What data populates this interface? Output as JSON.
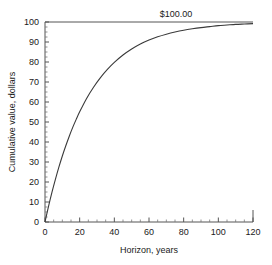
{
  "chart_data": {
    "type": "line",
    "title": "",
    "xlabel": "Horizon, years",
    "ylabel": "Cumulative value, dollars",
    "xlim": [
      0,
      120
    ],
    "ylim": [
      0,
      100
    ],
    "grid": false,
    "legend": null,
    "xticks": [
      0,
      20,
      40,
      60,
      80,
      100,
      120
    ],
    "xtick_labels": [
      "0",
      "20",
      "40",
      "60",
      "80",
      "100",
      "120"
    ],
    "x_minor_tick_interval": 5,
    "yticks": [
      0,
      10,
      20,
      30,
      40,
      50,
      60,
      70,
      80,
      90,
      100
    ],
    "ytick_labels": [
      "0",
      "10",
      "20",
      "30",
      "40",
      "50",
      "60",
      "70",
      "80",
      "90",
      "100"
    ],
    "y_minor_tick_interval": 2.5,
    "annotations": [
      {
        "text": "$100.00",
        "x": 62,
        "y": 100,
        "position": "above-asymptote"
      }
    ],
    "asymptote": 100,
    "series": [
      {
        "name": "Cumulative value",
        "color": "#3a3a3a",
        "x": [
          0,
          2,
          4,
          6,
          8,
          10,
          12,
          14,
          16,
          18,
          20,
          24,
          28,
          32,
          36,
          40,
          45,
          50,
          55,
          60,
          65,
          70,
          75,
          80,
          85,
          90,
          95,
          100,
          105,
          110,
          115,
          120
        ],
        "y": [
          0.0,
          7.7,
          14.8,
          21.3,
          27.4,
          33.0,
          38.1,
          42.9,
          47.3,
          51.3,
          55.1,
          61.8,
          67.4,
          72.2,
          76.3,
          79.8,
          83.5,
          86.5,
          89.0,
          91.0,
          92.6,
          93.9,
          95.0,
          95.9,
          96.6,
          97.2,
          97.7,
          98.2,
          98.5,
          98.8,
          99.0,
          99.2
        ]
      }
    ]
  },
  "axes": {
    "x_title": "Horizon, years",
    "y_title": "Cumulative value, dollars"
  },
  "annotation": {
    "asymptote_label": "$100.00"
  }
}
